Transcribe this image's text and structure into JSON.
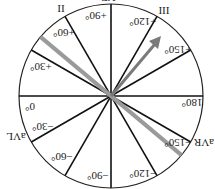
{
  "diagram": {
    "rotation_deg": 180,
    "center": [
      111,
      96
    ],
    "radius": 92,
    "axis_labels": [
      {
        "angle": 0,
        "text": "0°"
      },
      {
        "angle": 30,
        "text": "+30°"
      },
      {
        "angle": 60,
        "text": "+60°"
      },
      {
        "angle": 90,
        "text": "+90°"
      },
      {
        "angle": 120,
        "text": "+120°"
      },
      {
        "angle": 150,
        "text": "+150°"
      },
      {
        "angle": 180,
        "text": "180°"
      },
      {
        "angle": -30,
        "text": "−30°"
      },
      {
        "angle": -60,
        "text": "−60°"
      },
      {
        "angle": -90,
        "text": "−90°"
      },
      {
        "angle": -120,
        "text": "−120°"
      },
      {
        "angle": -150,
        "text": "−150°"
      }
    ],
    "lead_labels": {
      "lead_ii": "II",
      "lead_iii": "III",
      "lead_avf": "aVF",
      "lead_avl": "aVL",
      "lead_avr": "aVR"
    },
    "gray_line_angle": 40,
    "arrow_angle": 130,
    "colors": {
      "lines": "#111111",
      "gray": "#9a9a9a",
      "arrow": "#7a7a7a"
    }
  }
}
